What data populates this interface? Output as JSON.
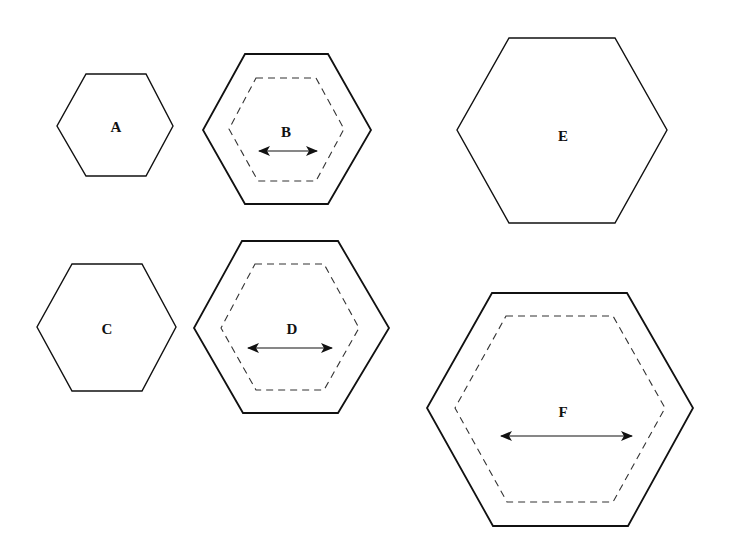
{
  "diagram": {
    "colors": {
      "stroke": "#111111",
      "dashed": "#333333",
      "background": "#ffffff"
    },
    "shapes": [
      {
        "label": "A",
        "style": "solid",
        "has_inner_dashed": false,
        "has_arrow": false
      },
      {
        "label": "B",
        "style": "solid-thick",
        "has_inner_dashed": true,
        "has_arrow": true
      },
      {
        "label": "C",
        "style": "solid",
        "has_inner_dashed": false,
        "has_arrow": false
      },
      {
        "label": "D",
        "style": "solid-thick",
        "has_inner_dashed": true,
        "has_arrow": true
      },
      {
        "label": "E",
        "style": "solid",
        "has_inner_dashed": false,
        "has_arrow": false
      },
      {
        "label": "F",
        "style": "solid-thick",
        "has_inner_dashed": true,
        "has_arrow": true
      }
    ]
  }
}
